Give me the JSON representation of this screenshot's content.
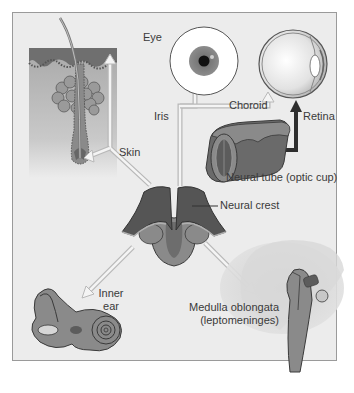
{
  "diagram": {
    "type": "neural-crest-derivatives",
    "colors": {
      "background": "#ececec",
      "border": "#9a9a9a",
      "tissue_dark": "#4d4d4d",
      "tissue_mid": "#7a7a7a",
      "tissue_light": "#a8a8a8",
      "arrow_outline": "#b8b8b8",
      "arrow_fill": "#f2f2f2",
      "retina_arrow": "#2e2e2e",
      "text": "#3a3a3a"
    },
    "center": {
      "label": "Neural crest"
    },
    "derivatives": [
      {
        "id": "skin",
        "label": "Skin"
      },
      {
        "id": "eye",
        "label": "Eye"
      },
      {
        "id": "iris",
        "label": "Iris"
      },
      {
        "id": "choroid",
        "label": "Choroid"
      },
      {
        "id": "retina",
        "label": "Retina"
      },
      {
        "id": "neural-tube",
        "label": "Neural tube (optic cup)"
      },
      {
        "id": "inner-ear",
        "label_line1": "Inner",
        "label_line2": "ear"
      },
      {
        "id": "medulla",
        "label_line1": "Medulla oblongata",
        "label_line2": "(leptomeninges)"
      }
    ]
  }
}
